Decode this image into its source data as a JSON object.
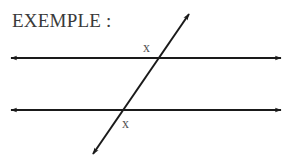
{
  "title": "EXEMPLE :",
  "diagram": {
    "type": "parallel-lines-with-transversal",
    "angle_labels": [
      "x",
      "x"
    ],
    "colors": {
      "line": "#1a1a1a",
      "text": "#3a3a3a"
    }
  }
}
